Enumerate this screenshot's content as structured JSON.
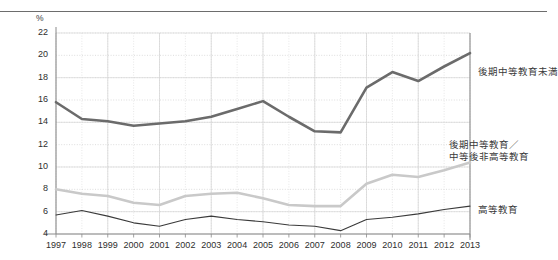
{
  "chart_data": {
    "type": "line",
    "title": "",
    "subtitle": "",
    "xlabel": "",
    "ylabel": "",
    "unit_label": "%",
    "grid": true,
    "legend_position": "right-inline",
    "ylim": [
      4,
      22
    ],
    "yticks": [
      4,
      6,
      8,
      10,
      12,
      14,
      16,
      18,
      20,
      22
    ],
    "ytick_labels": [
      "4",
      "6",
      "8",
      "10",
      "12",
      "14",
      "16",
      "18",
      "20",
      "22"
    ],
    "categories": [
      1997,
      1998,
      1999,
      2000,
      2001,
      2002,
      2003,
      2004,
      2005,
      2006,
      2007,
      2008,
      2009,
      2010,
      2011,
      2012,
      2013
    ],
    "xtick_labels": [
      "1997",
      "1998",
      "1999",
      "2000",
      "2001",
      "2002",
      "2003",
      "2004",
      "2005",
      "2006",
      "2007",
      "2008",
      "2009",
      "2010",
      "2011",
      "2012",
      "2013"
    ],
    "series": [
      {
        "name": "後期中等教育未満",
        "label_lines": [
          "後期中等教育未満"
        ],
        "color": "#6b6b6b",
        "width": 2.6,
        "values": [
          15.8,
          14.3,
          14.1,
          13.7,
          13.9,
          14.1,
          14.5,
          15.2,
          15.9,
          14.5,
          13.2,
          13.1,
          17.1,
          18.5,
          17.7,
          19.0,
          20.2
        ]
      },
      {
        "name": "後期中等教育／中等後非高等教育",
        "label_lines": [
          "後期中等教育／",
          "中等後非高等教育"
        ],
        "color": "#c9c9c9",
        "width": 2.6,
        "values": [
          8.0,
          7.6,
          7.4,
          6.8,
          6.6,
          7.4,
          7.6,
          7.7,
          7.2,
          6.6,
          6.5,
          6.5,
          8.5,
          9.3,
          9.1,
          9.7,
          10.4
        ]
      },
      {
        "name": "高等教育",
        "label_lines": [
          "高等教育"
        ],
        "color": "#3a3a3a",
        "width": 1.1,
        "values": [
          5.7,
          6.1,
          5.6,
          5.0,
          4.7,
          5.3,
          5.6,
          5.3,
          5.1,
          4.8,
          4.7,
          4.3,
          5.3,
          5.5,
          5.8,
          6.2,
          6.5
        ]
      }
    ],
    "colors": {
      "axis": "#8a8a8a",
      "grid_major": "#cfcfcf",
      "grid_minor": "#dcdcdc",
      "text": "#2e2e2e",
      "top_rule": "#6d6d6d"
    }
  },
  "annotations": {
    "series_label_0": "後期中等教育未満",
    "series_label_1_line1": "後期中等教育／",
    "series_label_1_line2": "中等後非高等教育",
    "series_label_2": "高等教育"
  }
}
